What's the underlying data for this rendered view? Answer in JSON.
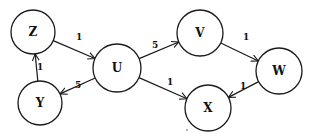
{
  "diagram": {
    "type": "directed-weighted-graph",
    "nodes": [
      {
        "id": "Z",
        "label": "Z",
        "cx": 33,
        "cy": 32,
        "r": 22
      },
      {
        "id": "Y",
        "label": "Y",
        "cx": 40,
        "cy": 103,
        "r": 22
      },
      {
        "id": "U",
        "label": "U",
        "cx": 117,
        "cy": 68,
        "r": 24
      },
      {
        "id": "V",
        "label": "V",
        "cx": 200,
        "cy": 33,
        "r": 23
      },
      {
        "id": "W",
        "label": "W",
        "cx": 279,
        "cy": 71,
        "r": 23
      },
      {
        "id": "X",
        "label": "X",
        "cx": 208,
        "cy": 108,
        "r": 23
      }
    ],
    "edges": [
      {
        "from": "Z",
        "to": "U",
        "weight": "1",
        "lx": 76,
        "ly": 40
      },
      {
        "from": "U",
        "to": "Y",
        "weight": "5",
        "lx": 75,
        "ly": 88
      },
      {
        "from": "Y",
        "to": "Z",
        "weight": "1",
        "lx": 37,
        "ly": 70
      },
      {
        "from": "U",
        "to": "V",
        "weight": "5",
        "lx": 152,
        "ly": 48
      },
      {
        "from": "U",
        "to": "X",
        "weight": "1",
        "lx": 167,
        "ly": 85
      },
      {
        "from": "V",
        "to": "W",
        "weight": "1",
        "lx": 243,
        "ly": 40
      },
      {
        "from": "W",
        "to": "X",
        "weight": "1",
        "lx": 240,
        "ly": 89
      }
    ],
    "colors": {
      "stroke": "#1a1a1a",
      "background": "#ffffff"
    }
  }
}
